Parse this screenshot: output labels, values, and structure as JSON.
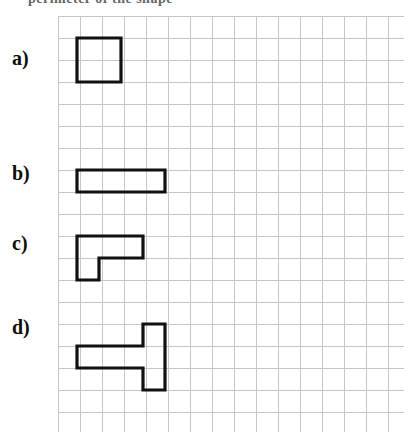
{
  "page": {
    "title_fragment": "perimeter of the shape",
    "background_color": "#ffffff"
  },
  "grid": {
    "cell_size_px": 22,
    "columns": 16,
    "rows": 19,
    "line_color": "#c6c6c6",
    "origin_x": 58,
    "origin_y": 16,
    "width": 346,
    "height": 416
  },
  "shape_style": {
    "stroke_color": "#111111",
    "stroke_width": 3.2,
    "fill": "none"
  },
  "items": [
    {
      "label": "a)",
      "name": "square-2x2",
      "description": "2 by 2 square",
      "cells": [
        [
          0,
          0
        ],
        [
          1,
          0
        ],
        [
          0,
          1
        ],
        [
          1,
          1
        ]
      ],
      "grid_origin": {
        "col": 1,
        "row": 1
      },
      "width_cells": 2,
      "height_cells": 2,
      "area_cells": 4,
      "perimeter_units": 8,
      "outline_points": "77,38 121,38 121,82 77,82 77,38"
    },
    {
      "label": "b)",
      "name": "rectangle-4x1",
      "description": "4 by 1 rectangle",
      "cells": [
        [
          0,
          0
        ],
        [
          1,
          0
        ],
        [
          2,
          0
        ],
        [
          3,
          0
        ]
      ],
      "grid_origin": {
        "col": 1,
        "row": 7
      },
      "width_cells": 4,
      "height_cells": 1,
      "area_cells": 4,
      "perimeter_units": 10,
      "outline_points": "77,170 165,170 165,192 77,192 77,170"
    },
    {
      "label": "c)",
      "name": "l-shape",
      "description": "L shape: three cells across the top, one cell below the left end",
      "cells": [
        [
          0,
          0
        ],
        [
          1,
          0
        ],
        [
          2,
          0
        ],
        [
          0,
          1
        ]
      ],
      "grid_origin": {
        "col": 1,
        "row": 11
      },
      "width_cells": 3,
      "height_cells": 2,
      "area_cells": 4,
      "perimeter_units": 10,
      "outline_points": "77,236 143,236 143,258 99,258 99,280 77,280 77,236"
    },
    {
      "label": "d)",
      "name": "t-shape",
      "description": "T shape: three cells across joined to a vertical bar of three cells at the right",
      "cells": [
        [
          0,
          1
        ],
        [
          1,
          1
        ],
        [
          2,
          0
        ],
        [
          2,
          1
        ],
        [
          2,
          2
        ]
      ],
      "grid_origin": {
        "col": 1,
        "row": 15
      },
      "width_cells": 3,
      "height_cells": 3,
      "area_cells": 5,
      "perimeter_units": 12,
      "outline_points": "77,346 143,346 143,324 165,324 165,390 143,390 143,368 77,368 77,346"
    }
  ]
}
